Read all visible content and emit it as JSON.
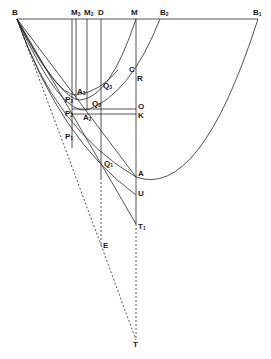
{
  "diagram": {
    "type": "geometric-construction",
    "stroke_color": "#2a2a2a",
    "labels": {
      "B": "B",
      "M3": "M",
      "M3_sub": "3",
      "M2": "M",
      "M2_sub": "2",
      "D": "D",
      "M": "M",
      "B2": "B",
      "B2_sub": "2",
      "B1": "B",
      "B1_sub": "1",
      "C": "C",
      "R": "R",
      "Q3": "Q",
      "Q3_sub": "3",
      "A3": "A",
      "A3_sub": "3",
      "P3": "P",
      "P3_sub": "3",
      "Q2": "Q",
      "Q2_sub": "2",
      "O": "O",
      "P2": "P",
      "P2_sub": "2",
      "K": "K",
      "A2": "A",
      "A2_sub": "2",
      "P1": "P",
      "P1_sub": "1",
      "Q1": "Q",
      "Q1_sub": "1",
      "A": "A",
      "U": "U",
      "T1": "T",
      "T1_sub": "1",
      "E": "E",
      "T": "T"
    }
  }
}
